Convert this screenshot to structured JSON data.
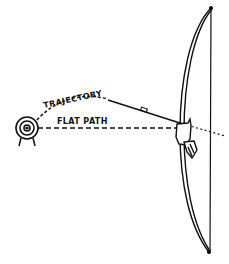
{
  "diagram": {
    "labels": {
      "trajectory": "TRAJECTORY",
      "flat_path": "FLAT PATH"
    },
    "elements": [
      {
        "name": "target",
        "description": "Bullseye target on stand, far left"
      },
      {
        "name": "trajectory",
        "description": "Dashed curved arc from bow to target"
      },
      {
        "name": "flat-path",
        "description": "Dashed straight horizontal line from bow to target"
      },
      {
        "name": "arrow",
        "description": "Arrow aimed upward along the trajectory"
      },
      {
        "name": "bow",
        "description": "Longbow drawn at right with string"
      },
      {
        "name": "hand",
        "description": "Archer's hand gripping the bow"
      }
    ],
    "colors": {
      "ink": "#111111",
      "background": "#ffffff"
    }
  }
}
